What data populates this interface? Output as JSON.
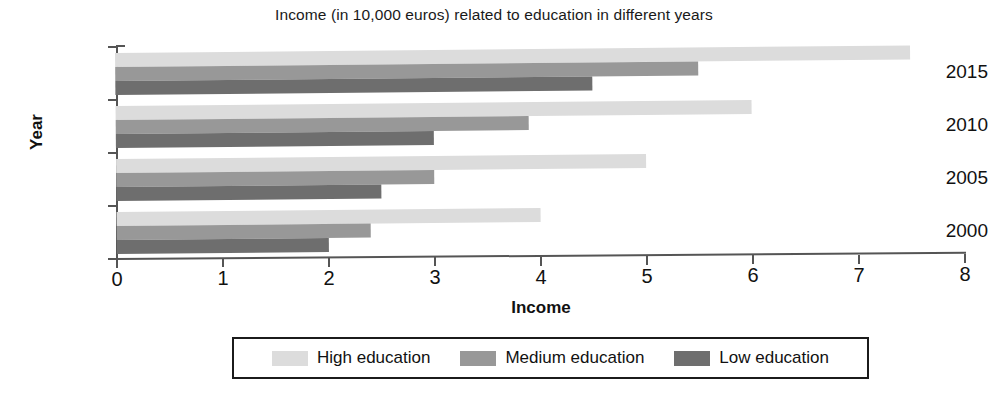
{
  "chart_data": {
    "type": "bar",
    "orientation": "horizontal",
    "title": "Income (in 10,000 euros) related to education in different years",
    "xlabel": "Income",
    "ylabel": "Year",
    "categories": [
      "2000",
      "2005",
      "2010",
      "2015"
    ],
    "series": [
      {
        "name": "High education",
        "color": "#dcdcdc",
        "values": [
          4.0,
          5.0,
          6.0,
          7.5
        ]
      },
      {
        "name": "Medium education",
        "color": "#989898",
        "values": [
          2.4,
          3.0,
          3.9,
          5.5
        ]
      },
      {
        "name": "Low education",
        "color": "#6e6e6e",
        "values": [
          2.0,
          2.5,
          3.0,
          4.5
        ]
      }
    ],
    "xlim": [
      0,
      8
    ],
    "xticks": [
      "0",
      "1",
      "2",
      "3",
      "4",
      "5",
      "6",
      "7",
      "8"
    ],
    "yticks": [
      "2015",
      "2010",
      "2005",
      "2000"
    ],
    "grid": false,
    "legend_position": "bottom"
  },
  "axes": {
    "y_title": "Year",
    "x_title": "Income",
    "y_tick_labels": [
      "2015",
      "2010",
      "2005",
      "2000"
    ],
    "x_tick_labels": [
      "0",
      "1",
      "2",
      "3",
      "4",
      "5",
      "6",
      "7",
      "8"
    ]
  },
  "legend": {
    "items": [
      {
        "label": "High education",
        "swatch": "s0"
      },
      {
        "label": "Medium education",
        "swatch": "s1"
      },
      {
        "label": "Low education",
        "swatch": "s2"
      }
    ]
  }
}
